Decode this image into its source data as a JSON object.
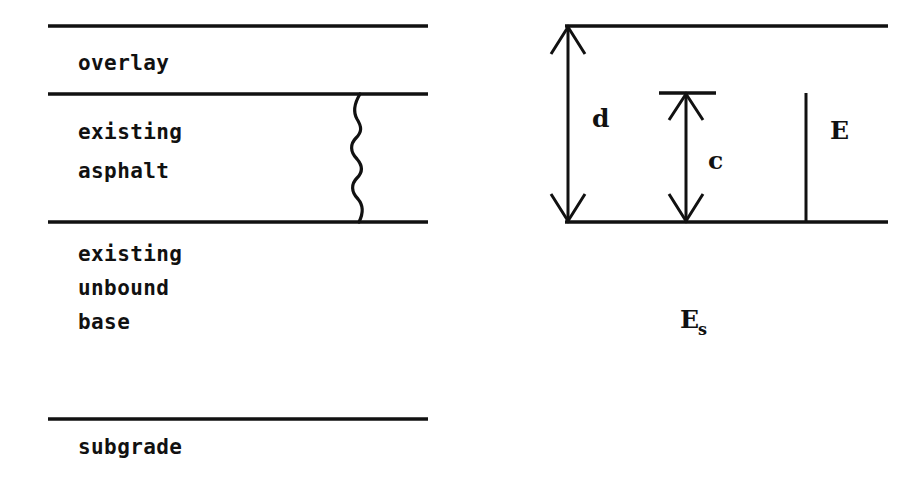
{
  "figure": {
    "background_color": "#ffffff",
    "ink_color": "#111111",
    "width": 923,
    "height": 485
  },
  "left_panel": {
    "name": "pavement-cross-section",
    "layers": [
      {
        "id": "overlay",
        "label": "overlay",
        "label_lines": [
          "overlay"
        ]
      },
      {
        "id": "existing-asphalt",
        "label": "existing asphalt",
        "label_lines": [
          "existing",
          "asphalt"
        ]
      },
      {
        "id": "existing-unbound-base",
        "label": "existing unbound base",
        "label_lines": [
          "existing",
          "unbound",
          "base"
        ]
      },
      {
        "id": "subgrade",
        "label": "subgrade",
        "label_lines": [
          "subgrade"
        ]
      }
    ],
    "boundaries": [
      {
        "id": "surface-line",
        "y": 26
      },
      {
        "id": "overlay-asphalt-interface",
        "y": 94
      },
      {
        "id": "asphalt-base-interface",
        "y": 222
      },
      {
        "id": "base-subgrade-interface",
        "y": 419
      }
    ],
    "crack": {
      "id": "reflective-crack",
      "description": "wavy vertical crack through existing asphalt",
      "x": 360,
      "y_top": 94,
      "y_bottom": 222,
      "bulges": 4
    }
  },
  "right_panel": {
    "name": "equivalent-stiffness-model",
    "boundaries": [
      {
        "id": "model-top-line",
        "y": 26
      },
      {
        "id": "model-bottom-line",
        "y": 222
      }
    ],
    "dimensions": [
      {
        "id": "total-thickness",
        "label": "d",
        "style": "double-headed-arrow",
        "x": 568,
        "y_top": 26,
        "y_bottom": 222,
        "label_x": 592,
        "label_y": 127
      },
      {
        "id": "crack-depth",
        "label": "c",
        "style": "double-headed-arrow-with-top-tick",
        "x": 686,
        "y_top": 93,
        "y_bottom": 222,
        "label_x": 708,
        "label_y": 169,
        "tick": {
          "x_start": 659,
          "x_end": 716,
          "y": 93
        }
      }
    ],
    "moduli": [
      {
        "id": "layer-modulus",
        "label": "E",
        "style": "plain-vertical-line",
        "x": 806,
        "y_top": 93,
        "y_bottom": 222,
        "label_x": 830,
        "label_y": 139
      },
      {
        "id": "subgrade-modulus",
        "label": "E",
        "subscript": "s",
        "style": "free-text",
        "label_x": 680,
        "label_y": 328
      }
    ]
  }
}
